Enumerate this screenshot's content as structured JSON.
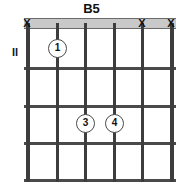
{
  "title": "B5",
  "position_label": "II",
  "geometry": {
    "board_width": 152,
    "board_height": 166,
    "string_x": [
      2,
      32,
      60,
      89,
      117,
      146
    ],
    "fret_y": [
      10,
      49,
      87,
      124,
      161
    ],
    "nut_height": 11
  },
  "strings": [
    {
      "name": "string-1",
      "x": 2,
      "marker": "X"
    },
    {
      "name": "string-2",
      "x": 32,
      "marker": ""
    },
    {
      "name": "string-3",
      "x": 60,
      "marker": ""
    },
    {
      "name": "string-4",
      "x": 89,
      "marker": ""
    },
    {
      "name": "string-5",
      "x": 117,
      "marker": "X"
    },
    {
      "name": "string-6",
      "x": 146,
      "marker": "X"
    }
  ],
  "open_muted_markers": [
    {
      "label": "X",
      "string": 1,
      "x": 2
    },
    {
      "label": "X",
      "string": 5,
      "x": 117
    },
    {
      "label": "X",
      "string": 6,
      "x": 146
    }
  ],
  "fingerings": [
    {
      "finger": "1",
      "string": 2,
      "fret_space": 1,
      "x": 32,
      "y": 30
    },
    {
      "finger": "3",
      "string": 3,
      "fret_space": 3,
      "x": 60,
      "y": 105
    },
    {
      "finger": "4",
      "string": 4,
      "fret_space": 3,
      "x": 89,
      "y": 105
    }
  ],
  "colors": {
    "nut_fill": "#c9c9c9",
    "line": "#4a4a4a",
    "text": "#111111",
    "background": "#ffffff"
  }
}
